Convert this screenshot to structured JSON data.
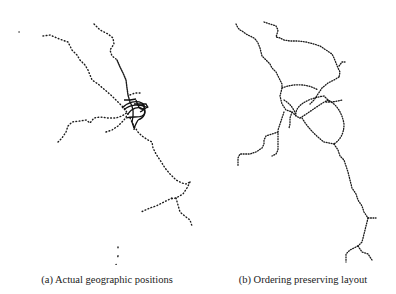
{
  "figure": {
    "panels": [
      {
        "id": "a",
        "caption": "(a) Actual geographic positions",
        "description": "Metro network stations plotted at their real geographic coordinates; dense tangled cluster near center",
        "dot_color": "#1a1a1a"
      },
      {
        "id": "b",
        "caption": "(b) Ordering preserving layout",
        "description": "Same metro network laid out with an ordering-preserving algorithm; central loops spread out into distinct curves",
        "dot_color": "#1a1a1a"
      }
    ]
  }
}
